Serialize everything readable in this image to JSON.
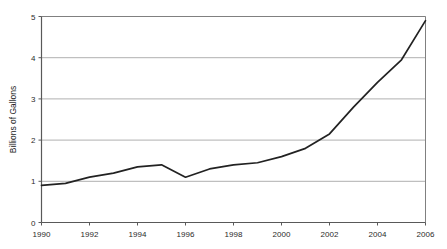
{
  "chart_data": {
    "type": "line",
    "title": "",
    "subtitle": "",
    "xlabel": "",
    "ylabel": "Billions of Gallons",
    "x": [
      1990,
      1991,
      1992,
      1993,
      1994,
      1995,
      1996,
      1997,
      1998,
      1999,
      2000,
      2001,
      2002,
      2003,
      2004,
      2005,
      2006
    ],
    "values": [
      0.9,
      0.95,
      1.1,
      1.2,
      1.35,
      1.4,
      1.1,
      1.3,
      1.4,
      1.45,
      1.6,
      1.8,
      2.15,
      2.8,
      3.4,
      3.95,
      4.9
    ],
    "series": [
      {
        "name": "Billions of Gallons",
        "values": [
          0.9,
          0.95,
          1.1,
          1.2,
          1.35,
          1.4,
          1.1,
          1.3,
          1.4,
          1.45,
          1.6,
          1.8,
          2.15,
          2.8,
          3.4,
          3.95,
          4.9
        ]
      }
    ],
    "xlim": [
      1990,
      2006
    ],
    "ylim": [
      0,
      5
    ],
    "x_tick_labels": [
      "1990",
      "1992",
      "1994",
      "1996",
      "1998",
      "2000",
      "2002",
      "2004",
      "2006"
    ],
    "x_tick_values": [
      1990,
      1992,
      1994,
      1996,
      1998,
      2000,
      2002,
      2004,
      2006
    ],
    "y_tick_labels": [
      "0",
      "1",
      "2",
      "3",
      "4",
      "5"
    ],
    "y_tick_values": [
      0,
      1,
      2,
      3,
      4,
      5
    ],
    "grid": "horizontal",
    "legend": "none",
    "line_color": "#222222",
    "grid_color": "#b0b0b0",
    "axis_color": "#808080",
    "background_color": "#ffffff",
    "annotations": []
  }
}
